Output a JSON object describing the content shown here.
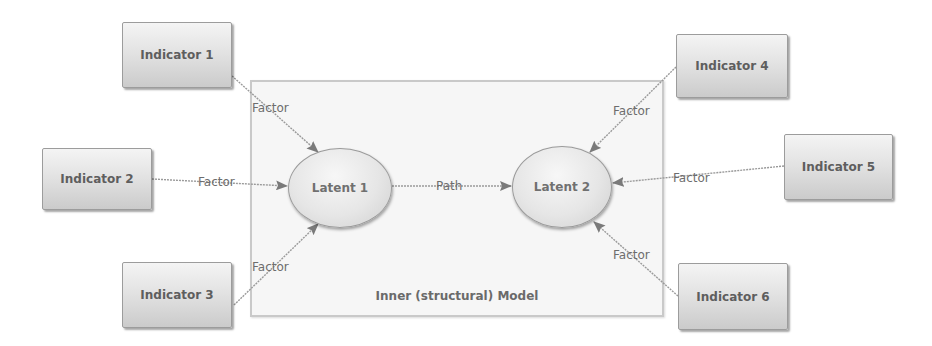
{
  "diagram": {
    "inner_model": {
      "title": "Inner (structural) Model",
      "box": {
        "x": 250,
        "y": 80,
        "w": 414,
        "h": 237
      },
      "title_pos": {
        "x": 457,
        "y": 289
      }
    },
    "indicators": [
      {
        "id": "ind1",
        "label": "Indicator 1",
        "x": 122,
        "y": 22,
        "w": 110,
        "h": 66
      },
      {
        "id": "ind2",
        "label": "Indicator 2",
        "x": 42,
        "y": 148,
        "w": 110,
        "h": 62
      },
      {
        "id": "ind3",
        "label": "Indicator 3",
        "x": 122,
        "y": 262,
        "w": 110,
        "h": 66
      },
      {
        "id": "ind4",
        "label": "Indicator 4",
        "x": 676,
        "y": 34,
        "w": 112,
        "h": 64
      },
      {
        "id": "ind5",
        "label": "Indicator 5",
        "x": 784,
        "y": 134,
        "w": 109,
        "h": 66
      },
      {
        "id": "ind6",
        "label": "Indicator 6",
        "x": 678,
        "y": 263,
        "w": 110,
        "h": 67
      }
    ],
    "latents": [
      {
        "id": "lat1",
        "label": "Latent 1",
        "cx": 340,
        "cy": 188,
        "rx": 52,
        "ry": 40
      },
      {
        "id": "lat2",
        "label": "Latent 2",
        "cx": 562,
        "cy": 187,
        "rx": 50,
        "ry": 41
      }
    ],
    "edges": [
      {
        "from": "Indicator 1",
        "to": "Latent 1",
        "label": "Factor",
        "x1": 232,
        "y1": 76,
        "x2": 318,
        "y2": 152,
        "lx": 252,
        "ly": 101
      },
      {
        "from": "Indicator 2",
        "to": "Latent 1",
        "label": "Factor",
        "x1": 152,
        "y1": 179,
        "x2": 287,
        "y2": 186,
        "lx": 198,
        "ly": 175
      },
      {
        "from": "Indicator 3",
        "to": "Latent 1",
        "label": "Factor",
        "x1": 234,
        "y1": 305,
        "x2": 318,
        "y2": 224,
        "lx": 252,
        "ly": 260
      },
      {
        "from": "Indicator 4",
        "to": "Latent 2",
        "label": "Factor",
        "x1": 676,
        "y1": 67,
        "x2": 590,
        "y2": 152,
        "lx": 613,
        "ly": 104
      },
      {
        "from": "Indicator 5",
        "to": "Latent 2",
        "label": "Factor",
        "x1": 784,
        "y1": 166,
        "x2": 613,
        "y2": 183,
        "lx": 673,
        "ly": 171
      },
      {
        "from": "Indicator 6",
        "to": "Latent 2",
        "label": "Factor",
        "x1": 678,
        "y1": 296,
        "x2": 594,
        "y2": 222,
        "lx": 613,
        "ly": 248
      },
      {
        "from": "Latent 1",
        "to": "Latent 2",
        "label": "Path",
        "x1": 392,
        "y1": 186,
        "x2": 511,
        "y2": 186,
        "lx": 436,
        "ly": 179
      }
    ],
    "colors": {
      "edge": "#9a9a9a",
      "arrowhead": "#7a7a7a",
      "text": "#5e5e5e",
      "box_border": "#c9c9c9",
      "box_fill": "#f6f6f6"
    }
  }
}
